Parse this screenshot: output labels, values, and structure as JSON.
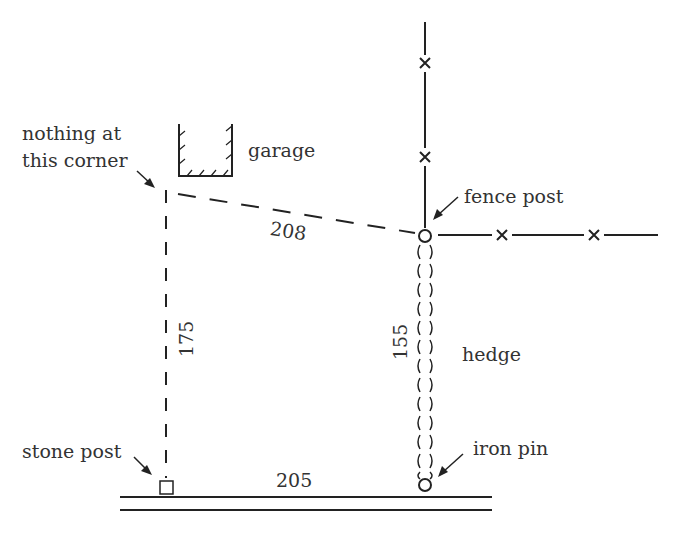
{
  "diagram": {
    "type": "property survey sketch",
    "labels": {
      "corner_line1": "nothing at",
      "corner_line2": "this corner",
      "garage": "garage",
      "fence_post": "fence post",
      "hedge": "hedge",
      "iron_pin": "iron pin",
      "stone_post": "stone post"
    },
    "measurements": {
      "top_diagonal": "208",
      "left_side": "175",
      "right_side": "155",
      "bottom_side": "205"
    },
    "colors": {
      "ink": "#222222",
      "background": "#ffffff"
    }
  }
}
